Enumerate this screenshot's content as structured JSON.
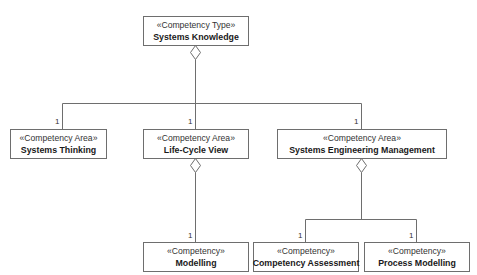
{
  "diagram": {
    "type": "UML composition hierarchy",
    "line_color": "#6e6e6e",
    "nodes": {
      "systems_knowledge": {
        "stereotype": "«Competency Type»",
        "name": "Systems Knowledge"
      },
      "systems_thinking": {
        "stereotype": "«Competency Area»",
        "name": "Systems Thinking"
      },
      "life_cycle_view": {
        "stereotype": "«Competency Area»",
        "name": "Life-Cycle View"
      },
      "systems_engineering_management": {
        "stereotype": "«Competency Area»",
        "name": "Systems Engineering Management"
      },
      "modelling": {
        "stereotype": "«Competency»",
        "name": "Modelling"
      },
      "competency_assessment": {
        "stereotype": "«Competency»",
        "name": "Competency Assessment"
      },
      "process_modelling": {
        "stereotype": "«Competency»",
        "name": "Process Modelling"
      }
    },
    "multiplicities": {
      "systems_thinking": "1",
      "life_cycle_view": "1",
      "systems_engineering_management": "1",
      "modelling": "1",
      "competency_assessment": "1",
      "process_modelling": "1"
    },
    "edges": [
      {
        "from": "Systems Knowledge",
        "to": "Systems Thinking",
        "kind": "aggregation",
        "multiplicity": "1"
      },
      {
        "from": "Systems Knowledge",
        "to": "Life-Cycle View",
        "kind": "aggregation",
        "multiplicity": "1"
      },
      {
        "from": "Systems Knowledge",
        "to": "Systems Engineering Management",
        "kind": "aggregation",
        "multiplicity": "1"
      },
      {
        "from": "Life-Cycle View",
        "to": "Modelling",
        "kind": "aggregation",
        "multiplicity": "1"
      },
      {
        "from": "Systems Engineering Management",
        "to": "Competency Assessment",
        "kind": "aggregation",
        "multiplicity": "1"
      },
      {
        "from": "Systems Engineering Management",
        "to": "Process Modelling",
        "kind": "aggregation",
        "multiplicity": "1"
      }
    ]
  }
}
